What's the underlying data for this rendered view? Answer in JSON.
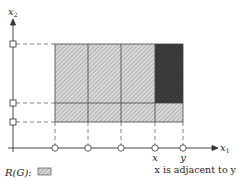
{
  "diagram": {
    "axes": {
      "x_label": "x",
      "x_label_sub": "1",
      "y_label": "x",
      "y_label_sub": "2"
    },
    "points": {
      "x_label": "x",
      "y_label": "y"
    },
    "caption": "x is adjacent to y",
    "legend": {
      "label": "R(G):"
    },
    "colors": {
      "hatch_fill": "#c8c8c8",
      "dark_fill": "#3a3a3a",
      "line": "#333333",
      "dashed": "#555555"
    }
  }
}
